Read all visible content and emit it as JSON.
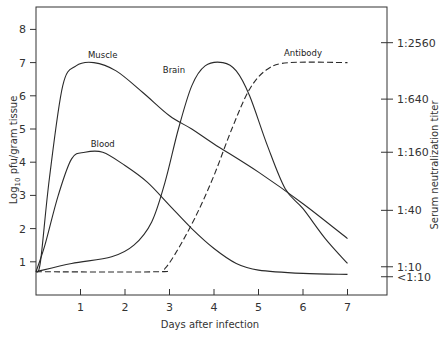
{
  "chart_data": {
    "type": "line",
    "title": "",
    "xlabel": "Days after infection",
    "ylabel": "Log10 pfu/gram tissue",
    "ylabel_right": "Serum neutralization titer",
    "xlim": [
      0,
      8
    ],
    "ylim": [
      0,
      8.8
    ],
    "x_ticks": [
      1,
      2,
      3,
      4,
      5,
      6,
      7
    ],
    "y_ticks": [
      1,
      2,
      3,
      4,
      5,
      6,
      7,
      8
    ],
    "y_right_ticks": [
      {
        "label": "1:2560",
        "y": 7.6
      },
      {
        "label": "1:640",
        "y": 5.9
      },
      {
        "label": "1:160",
        "y": 4.3
      },
      {
        "label": "1:40",
        "y": 2.55
      },
      {
        "label": "1:10",
        "y": 0.85
      },
      {
        "label": "<1:10",
        "y": 0.55
      }
    ],
    "grid": false,
    "legend": "inline labels",
    "series": [
      {
        "name": "Muscle",
        "style": "solid",
        "label_pos": {
          "x": 1.5,
          "y": 7.15
        },
        "points": [
          [
            0,
            0.7
          ],
          [
            0.1,
            1.0
          ],
          [
            0.3,
            3.5
          ],
          [
            0.6,
            6.3
          ],
          [
            0.9,
            6.9
          ],
          [
            1.3,
            7.0
          ],
          [
            1.8,
            6.75
          ],
          [
            2.4,
            6.1
          ],
          [
            3.0,
            5.4
          ],
          [
            3.5,
            5.0
          ],
          [
            4.0,
            4.55
          ],
          [
            5.0,
            3.7
          ],
          [
            6.0,
            2.75
          ],
          [
            7.0,
            1.7
          ]
        ]
      },
      {
        "name": "Blood",
        "style": "solid",
        "label_pos": {
          "x": 1.5,
          "y": 4.45
        },
        "points": [
          [
            0,
            0.7
          ],
          [
            0.2,
            1.5
          ],
          [
            0.5,
            3.0
          ],
          [
            0.8,
            4.1
          ],
          [
            1.1,
            4.3
          ],
          [
            1.5,
            4.3
          ],
          [
            2.0,
            3.9
          ],
          [
            2.5,
            3.4
          ],
          [
            3.0,
            2.7
          ],
          [
            3.5,
            2.0
          ],
          [
            4.0,
            1.4
          ],
          [
            4.5,
            0.95
          ],
          [
            5.0,
            0.75
          ],
          [
            6.0,
            0.65
          ],
          [
            7.0,
            0.62
          ]
        ]
      },
      {
        "name": "Brain",
        "style": "solid",
        "label_pos": {
          "x": 3.1,
          "y": 6.7
        },
        "points": [
          [
            0,
            0.7
          ],
          [
            0.8,
            0.95
          ],
          [
            1.7,
            1.15
          ],
          [
            2.2,
            1.5
          ],
          [
            2.6,
            2.2
          ],
          [
            2.9,
            3.4
          ],
          [
            3.2,
            5.0
          ],
          [
            3.5,
            6.3
          ],
          [
            3.8,
            6.9
          ],
          [
            4.2,
            7.0
          ],
          [
            4.5,
            6.75
          ],
          [
            4.8,
            6.0
          ],
          [
            5.2,
            4.5
          ],
          [
            5.6,
            3.2
          ],
          [
            6.0,
            2.6
          ],
          [
            6.5,
            1.7
          ],
          [
            7.0,
            0.95
          ]
        ]
      },
      {
        "name": "Antibody",
        "style": "dashed",
        "label_pos": {
          "x": 6.0,
          "y": 7.2
        },
        "points": [
          [
            0,
            0.7
          ],
          [
            2.7,
            0.7
          ],
          [
            2.9,
            0.8
          ],
          [
            3.2,
            1.4
          ],
          [
            3.6,
            2.4
          ],
          [
            4.0,
            3.6
          ],
          [
            4.4,
            5.0
          ],
          [
            4.8,
            6.2
          ],
          [
            5.2,
            6.8
          ],
          [
            5.7,
            7.0
          ],
          [
            7.0,
            7.0
          ]
        ]
      }
    ]
  }
}
